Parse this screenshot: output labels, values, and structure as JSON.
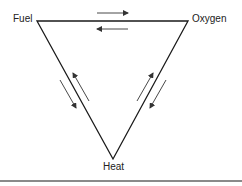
{
  "diagram": {
    "vertices": {
      "fuel": "Fuel",
      "oxygen": "Oxygen",
      "heat": "Heat"
    },
    "edges": [
      {
        "from": "Fuel",
        "to": "Oxygen",
        "arrows": "bidirectional"
      },
      {
        "from": "Fuel",
        "to": "Heat",
        "arrows": "bidirectional"
      },
      {
        "from": "Oxygen",
        "to": "Heat",
        "arrows": "bidirectional"
      }
    ],
    "colors": {
      "line": "#1a1a1a",
      "arrow": "#333333",
      "rule": "#8a8a8a"
    }
  }
}
